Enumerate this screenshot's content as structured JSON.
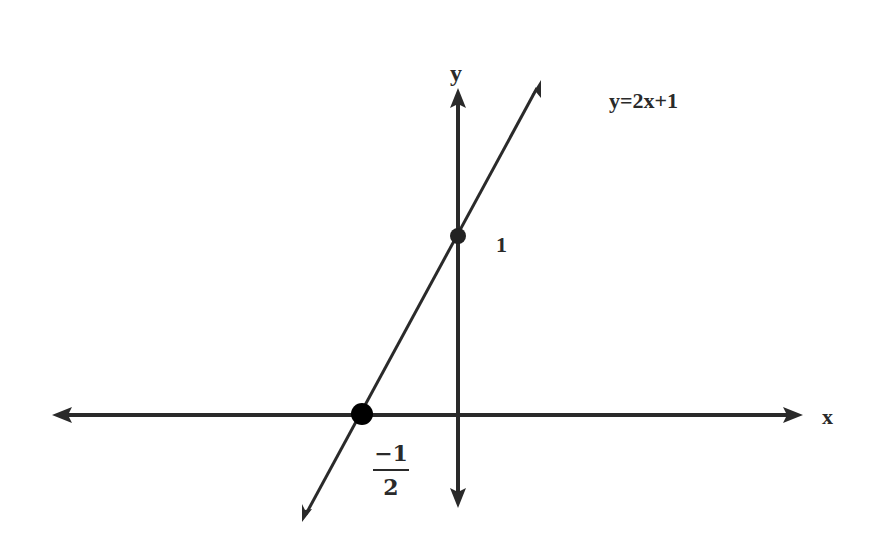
{
  "diagram": {
    "type": "coordinate-plane-line-graph",
    "axes": {
      "x_label": "x",
      "y_label": "y"
    },
    "equation_label": "y=2x+1",
    "points": [
      {
        "name": "y-intercept",
        "x": 0,
        "y": 1,
        "label": "1"
      },
      {
        "name": "x-intercept",
        "x": -0.5,
        "y": 0,
        "label_numerator": "−1",
        "label_denominator": "2"
      }
    ],
    "colors": {
      "stroke": "#2a2a2a",
      "point": "#000000",
      "background": "#ffffff"
    }
  }
}
